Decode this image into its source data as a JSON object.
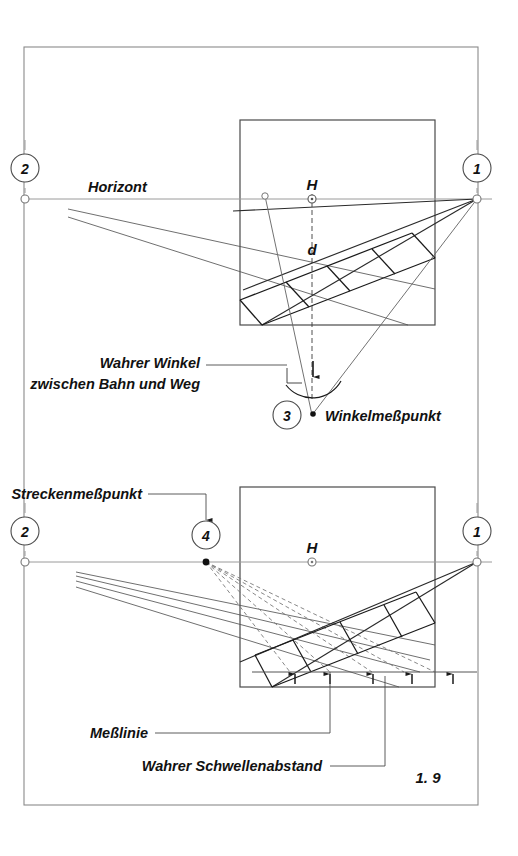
{
  "figure": {
    "number": "1. 9",
    "domain": "perspective-construction-drawing",
    "language": "de"
  },
  "frame": {
    "x": 24,
    "y": 47,
    "width": 454,
    "height": 758
  },
  "labels": {
    "horizont": "Horizont",
    "h_upper": "H",
    "h_lower": "H",
    "d": "d",
    "wahrer_winkel_line1": "Wahrer Winkel",
    "wahrer_winkel_line2": "zwischen Bahn und Weg",
    "winkelmesspunkt": "Winkelmeßpunkt",
    "streckenmesspunkt": "Streckenmeßpunkt",
    "messlinie": "Meßlinie",
    "wahrer_schwellenabstand": "Wahrer Schwellenabstand"
  },
  "markers": {
    "vp1_upper": "1",
    "vp2_upper": "2",
    "vp1_lower": "1",
    "vp2_lower": "2",
    "angle_point": "3",
    "distance_point": "4"
  },
  "upper_diagram": {
    "picture_box": {
      "x": 240,
      "y": 120,
      "width": 195,
      "height": 205
    },
    "horizon_y": 199,
    "vp_left": {
      "x": 25,
      "y": 199
    },
    "vp_right": {
      "x": 477,
      "y": 199
    },
    "center_h": {
      "x": 312,
      "y": 194
    },
    "station_point": {
      "x": 312,
      "y": 415
    },
    "left_inner_point": {
      "x": 265,
      "y": 196
    }
  },
  "lower_diagram": {
    "picture_box": {
      "x": 240,
      "y": 487,
      "width": 195,
      "height": 200
    },
    "horizon_y": 562,
    "vp_left": {
      "x": 25,
      "y": 562
    },
    "vp_right": {
      "x": 477,
      "y": 562
    },
    "center_h": {
      "x": 312,
      "y": 562
    },
    "measuring_point": {
      "x": 206,
      "y": 562
    },
    "measure_line_y": 672
  },
  "colors": {
    "ink": "#1a1a1a",
    "thin_line": "#6a6a6a",
    "paper": "#ffffff"
  }
}
